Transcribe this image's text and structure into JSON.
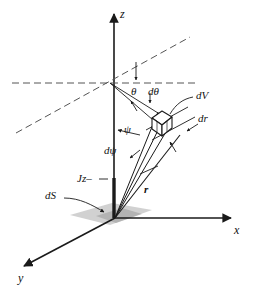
{
  "figure": {
    "background_color": "#ffffff",
    "stroke_color": "#1a1a1a",
    "shade_color": "#b8b8b8",
    "width": 254,
    "height": 295
  },
  "axes": [
    {
      "name": "z-axis",
      "label": "z",
      "label_x": 120,
      "label_y": 8,
      "direction": "up"
    },
    {
      "name": "x-axis",
      "label": "x",
      "label_x": 234,
      "label_y": 224,
      "direction": "right"
    },
    {
      "name": "y-axis",
      "label": "y",
      "label_x": 18,
      "label_y": 272,
      "direction": "down-left"
    }
  ],
  "origin": {
    "x": 115,
    "y": 218
  },
  "vertex": {
    "x": 110,
    "y": 83
  },
  "labels": [
    {
      "name": "theta-label",
      "text": "θ",
      "x": 131,
      "y": 86,
      "style": "sym"
    },
    {
      "name": "dtheta-label",
      "text": "dθ",
      "x": 148,
      "y": 86,
      "style": "sym"
    },
    {
      "name": "dV-label",
      "text": "dV",
      "x": 196,
      "y": 95,
      "style": "sym"
    },
    {
      "name": "dr-label",
      "text": "dr",
      "x": 198,
      "y": 118,
      "style": "sym"
    },
    {
      "name": "psi-label",
      "text": "ψ",
      "x": 124,
      "y": 127,
      "style": "sym"
    },
    {
      "name": "dpsi-label",
      "text": "dψ",
      "x": 106,
      "y": 147,
      "style": "sym"
    },
    {
      "name": "r-label",
      "text": "r",
      "x": 143,
      "y": 188,
      "style": "bold"
    },
    {
      "name": "Jz-label",
      "text": "Jz–",
      "x": 78,
      "y": 182,
      "style": "sym"
    },
    {
      "name": "dS-label",
      "text": "dS",
      "x": 46,
      "y": 199,
      "style": "sym"
    }
  ],
  "elements": {
    "volume_element": "dV",
    "surface_element": "dS",
    "radial_thickness": "dr",
    "polar_increment": "dθ",
    "azimuth_increment": "dψ",
    "radius": "r",
    "flux": "Jz–"
  }
}
